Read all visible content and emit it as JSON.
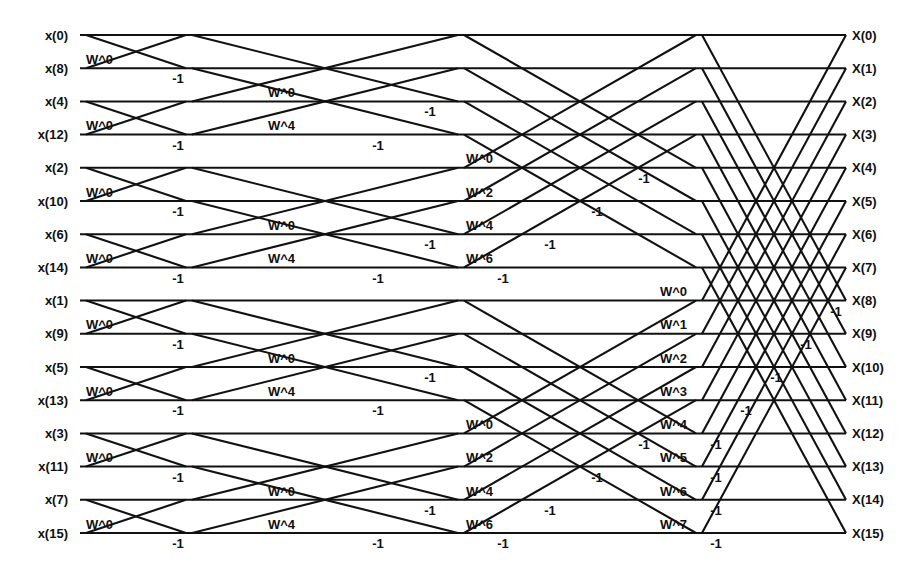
{
  "figure": {
    "type": "diagram",
    "kind": "fft-butterfly-signal-flow-graph",
    "n_points": 16,
    "n_stages": 4,
    "width": 914,
    "height": 576,
    "line_color": "#111111",
    "text_color": "#101010",
    "background": "#ffffff"
  },
  "layout": {
    "row_top_y": 35,
    "row_spacing": 33.2,
    "line_left_x": 80,
    "line_right_x": 846,
    "input_label_x": 68,
    "output_label_x": 852,
    "label_baseline_offset": 4.5,
    "stages": [
      {
        "index": 1,
        "x_start": 86,
        "x_end": 186,
        "span_rows": 1
      },
      {
        "index": 2,
        "x_start": 192,
        "x_end": 458,
        "span_rows": 2
      },
      {
        "index": 3,
        "x_start": 464,
        "x_end": 696,
        "span_rows": 4
      },
      {
        "index": 4,
        "x_start": 702,
        "x_end": 846,
        "span_rows": 8
      }
    ]
  },
  "inputs": [
    "x(0)",
    "x(8)",
    "x(4)",
    "x(12)",
    "x(2)",
    "x(10)",
    "x(6)",
    "x(14)",
    "x(1)",
    "x(9)",
    "x(5)",
    "x(13)",
    "x(3)",
    "x(11)",
    "x(7)",
    "x(15)"
  ],
  "outputs": [
    "X(0)",
    "X(1)",
    "X(2)",
    "X(3)",
    "X(4)",
    "X(5)",
    "X(6)",
    "X(7)",
    "X(8)",
    "X(9)",
    "X(10)",
    "X(11)",
    "X(12)",
    "X(13)",
    "X(14)",
    "X(15)"
  ],
  "stage_twiddles": {
    "stage1": [
      "W^0"
    ],
    "stage2": [
      "W^0",
      "W^4"
    ],
    "stage3": [
      "W^0",
      "W^2",
      "W^4",
      "W^6"
    ],
    "stage4": [
      "W^0",
      "W^1",
      "W^2",
      "W^3",
      "W^4",
      "W^5",
      "W^6",
      "W^7"
    ]
  },
  "minus_one_label": "-1",
  "twiddle_labels": [
    {
      "text": "W^0",
      "x": 86,
      "y": 64,
      "anchor": "start"
    },
    {
      "text": "W^0",
      "x": 86,
      "y": 130,
      "anchor": "start"
    },
    {
      "text": "W^0",
      "x": 86,
      "y": 197,
      "anchor": "start"
    },
    {
      "text": "W^0",
      "x": 86,
      "y": 263,
      "anchor": "start"
    },
    {
      "text": "W^0",
      "x": 86,
      "y": 329,
      "anchor": "start"
    },
    {
      "text": "W^0",
      "x": 86,
      "y": 396,
      "anchor": "start"
    },
    {
      "text": "W^0",
      "x": 86,
      "y": 462,
      "anchor": "start"
    },
    {
      "text": "W^0",
      "x": 86,
      "y": 529,
      "anchor": "start"
    },
    {
      "text": "W^0",
      "x": 268,
      "y": 97,
      "anchor": "start"
    },
    {
      "text": "W^4",
      "x": 268,
      "y": 130,
      "anchor": "start"
    },
    {
      "text": "W^0",
      "x": 268,
      "y": 230,
      "anchor": "start"
    },
    {
      "text": "W^4",
      "x": 268,
      "y": 263,
      "anchor": "start"
    },
    {
      "text": "W^0",
      "x": 268,
      "y": 363,
      "anchor": "start"
    },
    {
      "text": "W^4",
      "x": 268,
      "y": 396,
      "anchor": "start"
    },
    {
      "text": "W^0",
      "x": 268,
      "y": 496,
      "anchor": "start"
    },
    {
      "text": "W^4",
      "x": 268,
      "y": 529,
      "anchor": "start"
    },
    {
      "text": "W^0",
      "x": 466,
      "y": 163,
      "anchor": "start"
    },
    {
      "text": "W^2",
      "x": 466,
      "y": 197,
      "anchor": "start"
    },
    {
      "text": "W^4",
      "x": 466,
      "y": 230,
      "anchor": "start"
    },
    {
      "text": "W^6",
      "x": 466,
      "y": 263,
      "anchor": "start"
    },
    {
      "text": "W^0",
      "x": 466,
      "y": 429,
      "anchor": "start"
    },
    {
      "text": "W^2",
      "x": 466,
      "y": 462,
      "anchor": "start"
    },
    {
      "text": "W^4",
      "x": 466,
      "y": 496,
      "anchor": "start"
    },
    {
      "text": "W^6",
      "x": 466,
      "y": 529,
      "anchor": "start"
    },
    {
      "text": "W^0",
      "x": 660,
      "y": 296,
      "anchor": "start"
    },
    {
      "text": "W^1",
      "x": 660,
      "y": 329,
      "anchor": "start"
    },
    {
      "text": "W^2",
      "x": 660,
      "y": 363,
      "anchor": "start"
    },
    {
      "text": "W^3",
      "x": 660,
      "y": 396,
      "anchor": "start"
    },
    {
      "text": "W^4",
      "x": 660,
      "y": 429,
      "anchor": "start"
    },
    {
      "text": "W^5",
      "x": 660,
      "y": 462,
      "anchor": "start"
    },
    {
      "text": "W^6",
      "x": 660,
      "y": 496,
      "anchor": "start"
    },
    {
      "text": "W^7",
      "x": 660,
      "y": 529,
      "anchor": "start"
    }
  ],
  "minus_labels": [
    {
      "text": "-1",
      "x": 178,
      "y": 83
    },
    {
      "text": "-1",
      "x": 178,
      "y": 150
    },
    {
      "text": "-1",
      "x": 178,
      "y": 216
    },
    {
      "text": "-1",
      "x": 178,
      "y": 283
    },
    {
      "text": "-1",
      "x": 178,
      "y": 349
    },
    {
      "text": "-1",
      "x": 178,
      "y": 415
    },
    {
      "text": "-1",
      "x": 178,
      "y": 482
    },
    {
      "text": "-1",
      "x": 178,
      "y": 548
    },
    {
      "text": "-1",
      "x": 430,
      "y": 116
    },
    {
      "text": "-1",
      "x": 378,
      "y": 150
    },
    {
      "text": "-1",
      "x": 430,
      "y": 249
    },
    {
      "text": "-1",
      "x": 378,
      "y": 283
    },
    {
      "text": "-1",
      "x": 430,
      "y": 382
    },
    {
      "text": "-1",
      "x": 378,
      "y": 415
    },
    {
      "text": "-1",
      "x": 430,
      "y": 515
    },
    {
      "text": "-1",
      "x": 378,
      "y": 548
    },
    {
      "text": "-1",
      "x": 644,
      "y": 183
    },
    {
      "text": "-1",
      "x": 597,
      "y": 216
    },
    {
      "text": "-1",
      "x": 550,
      "y": 249
    },
    {
      "text": "-1",
      "x": 503,
      "y": 283
    },
    {
      "text": "-1",
      "x": 644,
      "y": 449
    },
    {
      "text": "-1",
      "x": 597,
      "y": 482
    },
    {
      "text": "-1",
      "x": 550,
      "y": 515
    },
    {
      "text": "-1",
      "x": 503,
      "y": 548
    },
    {
      "text": "-1",
      "x": 836,
      "y": 316
    },
    {
      "text": "-1",
      "x": 806,
      "y": 349
    },
    {
      "text": "-1",
      "x": 776,
      "y": 382
    },
    {
      "text": "-1",
      "x": 746,
      "y": 415
    },
    {
      "text": "-1",
      "x": 716,
      "y": 449
    },
    {
      "text": "-1",
      "x": 716,
      "y": 482
    },
    {
      "text": "-1",
      "x": 716,
      "y": 515
    },
    {
      "text": "-1",
      "x": 716,
      "y": 548
    }
  ]
}
